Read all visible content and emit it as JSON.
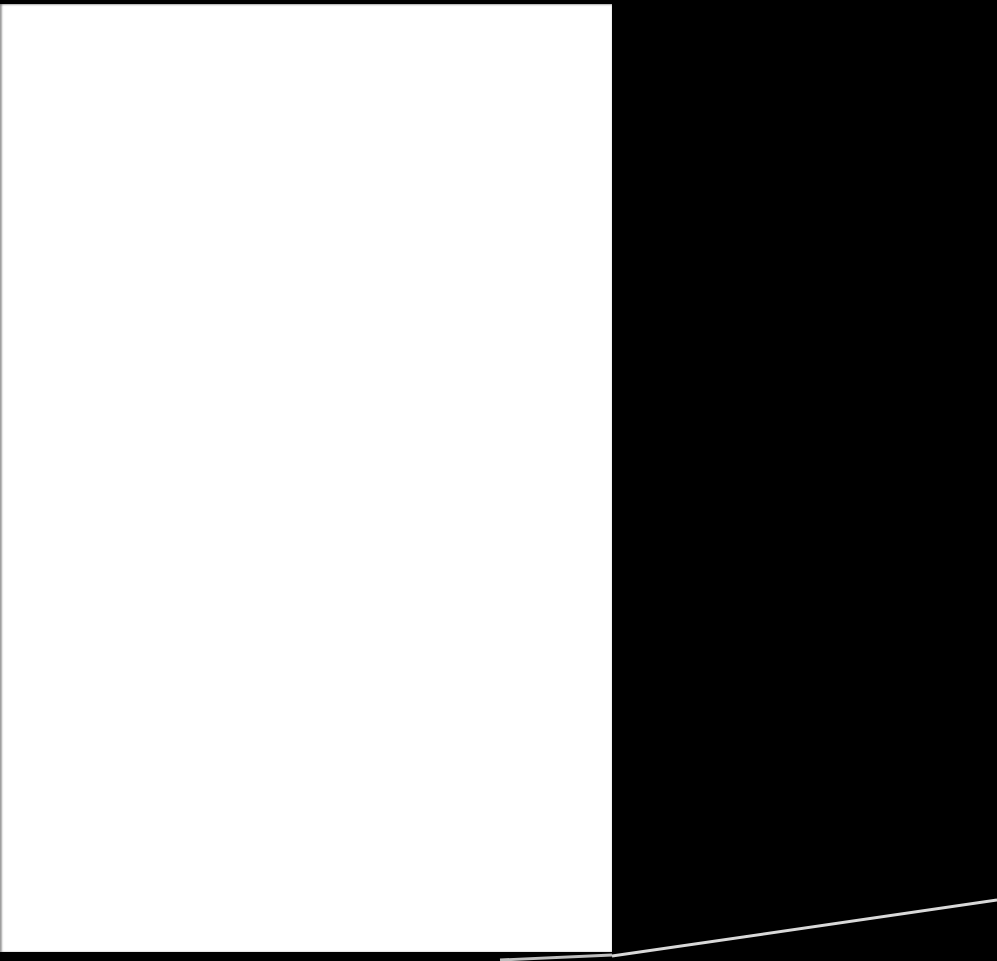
{
  "scene": {
    "background_color": "#000000",
    "description": "Scanned blank page on black background"
  },
  "page": {
    "color": "#ffffff",
    "text": ""
  },
  "edge_line": {
    "color": "#d9d9d9"
  }
}
